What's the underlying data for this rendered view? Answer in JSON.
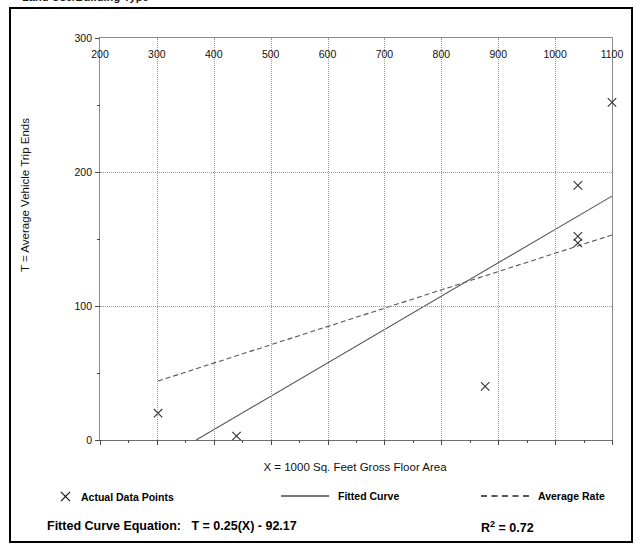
{
  "header": {
    "clipped_title": "Land Use/Building Type"
  },
  "chart_data": {
    "type": "scatter",
    "title": "",
    "xlabel": "X = 1000 Sq. Feet Gross Floor Area",
    "ylabel": "T = Average Vehicle Trip Ends",
    "xlim": [
      200,
      1100
    ],
    "ylim": [
      0,
      300
    ],
    "xticks": [
      200,
      300,
      400,
      500,
      600,
      700,
      800,
      900,
      1000,
      1100
    ],
    "yticks": [
      0,
      100,
      200,
      300
    ],
    "y_minor_ticks": [
      50,
      150,
      250
    ],
    "grid": true,
    "legend_position": "below",
    "points": [
      {
        "x": 302,
        "y": 20
      },
      {
        "x": 440,
        "y": 3
      },
      {
        "x": 877,
        "y": 40
      },
      {
        "x": 1040,
        "y": 190
      },
      {
        "x": 1040,
        "y": 152
      },
      {
        "x": 1040,
        "y": 147
      },
      {
        "x": 1100,
        "y": 252
      }
    ],
    "series": [
      {
        "name": "Fitted Curve",
        "style": "solid",
        "equation": "T = 0.25(X) - 92.17",
        "x": [
          369,
          1100
        ],
        "values": [
          0,
          182
        ]
      },
      {
        "name": "Average Rate",
        "style": "dashed",
        "x": [
          302,
          1100
        ],
        "values": [
          44,
          153
        ]
      }
    ],
    "legend": [
      {
        "label": "Actual Data Points",
        "marker": "x-marker-icon"
      },
      {
        "label": "Fitted Curve",
        "marker": "solid-line-icon"
      },
      {
        "label": "Average Rate",
        "marker": "dashed-line-icon"
      }
    ],
    "annotations": {
      "equation_label": "Fitted Curve Equation:",
      "equation_value": "T = 0.25(X) - 92.17",
      "r_squared_label": "R",
      "r_squared_exp": "2",
      "r_squared_value": "= 0.72"
    }
  },
  "colors": {
    "frame": "#000000",
    "axis": "#8a8a8a",
    "grid": "#9a9a9a",
    "fitted_curve": "#555555",
    "average_rate": "#555555",
    "marker": "#333333",
    "text": "#000000"
  }
}
